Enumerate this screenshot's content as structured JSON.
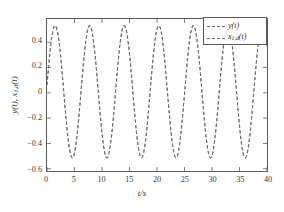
{
  "figure": {
    "background_color": "#ffffff",
    "frame_color": "#5a5a5a",
    "line_color": "#6a6a6a",
    "caption_remnant": " "
  },
  "axis": {
    "xlabel": "t/s",
    "ylabel_main": "y(t), x",
    "ylabel_sub": "1,d",
    "ylabel_tail": "(t)",
    "xticks": [
      "0",
      "5",
      "10",
      "15",
      "20",
      "25",
      "30",
      "35",
      "40"
    ],
    "yticks": [
      "0.4",
      "0.2",
      "0",
      "−0.2",
      "−0.4",
      "−0.6"
    ]
  },
  "legend": {
    "entries": [
      {
        "label": "y(t)",
        "style": "dashed"
      },
      {
        "label": "x",
        "sub": "1,d",
        "tail": "(t)",
        "style": "dashed"
      }
    ]
  },
  "chart_data": {
    "type": "line",
    "title": "",
    "xlabel": "t/s",
    "ylabel": "y(t), x_{1,d}(t)",
    "xlim": [
      0,
      40
    ],
    "ylim": [
      -0.6,
      0.55
    ],
    "xticks": [
      0,
      5,
      10,
      15,
      20,
      25,
      30,
      35,
      40
    ],
    "yticks": [
      0.4,
      0.2,
      0,
      -0.2,
      -0.4,
      -0.6
    ],
    "grid": false,
    "legend_position": "upper right",
    "series": [
      {
        "name": "y(t)",
        "linestyle": "dashed",
        "color": "#6a6a6a",
        "description": "Sinusoid of amplitude 0.5, period 2*pi (~6.283 s), phase such that y(0)~0.05, first peak near t=1.62 s",
        "amplitude": 0.5,
        "period": 6.283,
        "phase_offset_seconds": 0.1,
        "mean": 0.0,
        "peaks_t": [
          1.62,
          7.9,
          14.19,
          20.47,
          26.75,
          33.04,
          39.32
        ],
        "troughs_t": [
          4.76,
          11.04,
          17.33,
          23.61,
          29.89,
          36.18
        ],
        "peak_value": 0.5,
        "trough_value": -0.5
      },
      {
        "name": "x_{1,d}(t)",
        "linestyle": "dashed",
        "color": "#6a6a6a",
        "description": "Reference sinusoid coincident with y(t) over the displayed range",
        "amplitude": 0.5,
        "period": 6.283,
        "phase_offset_seconds": 0.1,
        "mean": 0.0,
        "peak_value": 0.5,
        "trough_value": -0.5
      }
    ]
  }
}
